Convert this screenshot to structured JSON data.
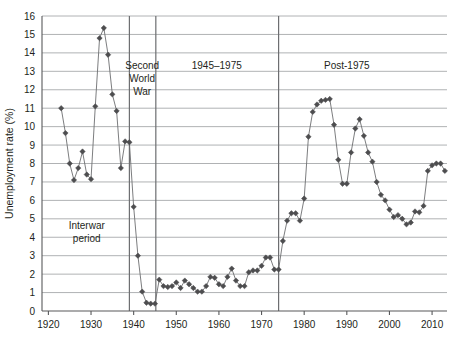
{
  "chart_data": {
    "type": "line",
    "title": "",
    "xlabel": "",
    "ylabel": "Unemployment rate (%)",
    "xlim": [
      1918.5,
      2013.5
    ],
    "ylim": [
      0,
      16
    ],
    "xticks": [
      1920,
      1930,
      1940,
      1950,
      1960,
      1970,
      1980,
      1990,
      2000,
      2010
    ],
    "yticks": [
      0,
      1,
      2,
      3,
      4,
      5,
      6,
      7,
      8,
      9,
      10,
      11,
      12,
      13,
      14,
      15,
      16
    ],
    "xtick_labels": [
      "1920",
      "1930",
      "1940",
      "1950",
      "1960",
      "1970",
      "1980",
      "1990",
      "2000",
      "2010"
    ],
    "ytick_labels": [
      "0",
      "1",
      "2",
      "3",
      "4",
      "5",
      "6",
      "7",
      "8",
      "9",
      "10",
      "11",
      "12",
      "13",
      "14",
      "15",
      "16"
    ],
    "grid": true,
    "grid_axis": "y",
    "legend": false,
    "marker": "diamond",
    "line_color": "#6d6e71",
    "marker_color": "#4d4d4f",
    "grid_color": "#a7a9ac",
    "axis_color": "#58595b",
    "series": [
      {
        "name": "Unemployment rate",
        "x": [
          1923,
          1924,
          1925,
          1926,
          1927,
          1928,
          1929,
          1930,
          1931,
          1932,
          1933,
          1934,
          1935,
          1936,
          1937,
          1938,
          1939,
          1940,
          1941,
          1942,
          1943,
          1944,
          1945,
          1946,
          1947,
          1948,
          1949,
          1950,
          1951,
          1952,
          1953,
          1954,
          1955,
          1956,
          1957,
          1958,
          1959,
          1960,
          1961,
          1962,
          1963,
          1964,
          1965,
          1966,
          1967,
          1968,
          1969,
          1970,
          1971,
          1972,
          1973,
          1974,
          1975,
          1976,
          1977,
          1978,
          1979,
          1980,
          1981,
          1982,
          1983,
          1984,
          1985,
          1986,
          1987,
          1988,
          1989,
          1990,
          1991,
          1992,
          1993,
          1994,
          1995,
          1996,
          1997,
          1998,
          1999,
          2000,
          2001,
          2002,
          2003,
          2004,
          2005,
          2006,
          2007,
          2008,
          2009,
          2010,
          2011,
          2012,
          2013
        ],
        "values": [
          11.0,
          9.65,
          8.0,
          7.1,
          7.75,
          8.65,
          7.4,
          7.15,
          11.1,
          14.8,
          15.35,
          13.9,
          11.75,
          10.85,
          7.75,
          9.2,
          9.15,
          5.65,
          3.0,
          1.05,
          0.45,
          0.4,
          0.4,
          1.7,
          1.35,
          1.3,
          1.35,
          1.55,
          1.25,
          1.65,
          1.45,
          1.25,
          1.05,
          1.05,
          1.35,
          1.85,
          1.8,
          1.45,
          1.35,
          1.85,
          2.3,
          1.65,
          1.35,
          1.35,
          2.1,
          2.2,
          2.2,
          2.45,
          2.9,
          2.9,
          2.25,
          2.25,
          3.8,
          4.9,
          5.3,
          5.3,
          4.9,
          6.1,
          9.45,
          10.8,
          11.2,
          11.4,
          11.45,
          11.5,
          10.1,
          8.2,
          6.9,
          6.9,
          8.6,
          9.9,
          10.4,
          9.5,
          8.6,
          8.1,
          7.0,
          6.3,
          6.0,
          5.5,
          5.1,
          5.2,
          5.0,
          4.7,
          4.8,
          5.4,
          5.35,
          5.7,
          7.6,
          7.9,
          8.0,
          8.0,
          7.6
        ]
      }
    ],
    "annotations": [
      {
        "name": "interwar-period",
        "text_lines": [
          "Interwar",
          "period"
        ],
        "x": 1929,
        "y": 4.45
      },
      {
        "name": "second-world-war",
        "text_lines": [
          "Second",
          "World",
          "War"
        ],
        "x": 1942,
        "y": 13.1
      },
      {
        "name": "period-1945-1975",
        "text_lines": [
          "1945–1975"
        ],
        "x": 1959.5,
        "y": 13.1
      },
      {
        "name": "post-1975",
        "text_lines": [
          "Post-1975"
        ],
        "x": 1990,
        "y": 13.1
      }
    ],
    "period_dividers": [
      {
        "name": "divider-1939",
        "x": 1939
      },
      {
        "name": "divider-1945",
        "x": 1945.2
      },
      {
        "name": "divider-1974",
        "x": 1974
      }
    ]
  }
}
